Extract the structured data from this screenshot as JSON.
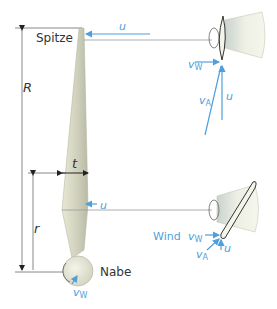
{
  "diagram": {
    "labels": {
      "tip": "Spitze",
      "hub": "Nabe",
      "radius_full": "R",
      "radius_partial": "r",
      "chord": "t",
      "wind": "Wind"
    },
    "vectors": {
      "circumferential_top": "u",
      "circumferential_mid": "u",
      "top_detail": {
        "wind": "v",
        "wind_sub": "W",
        "apparent": "v",
        "apparent_sub": "A",
        "circ": "u"
      },
      "bottom_detail": {
        "wind": "v",
        "wind_sub": "W",
        "apparent": "v",
        "apparent_sub": "A",
        "circ": "u"
      },
      "hub_wind": "v",
      "hub_wind_sub": "W"
    },
    "colors": {
      "vector_blue": "#4f9fdb",
      "line_gray": "#888888",
      "blade_fill": "#d6d7c4",
      "text_dark": "#333333"
    }
  }
}
